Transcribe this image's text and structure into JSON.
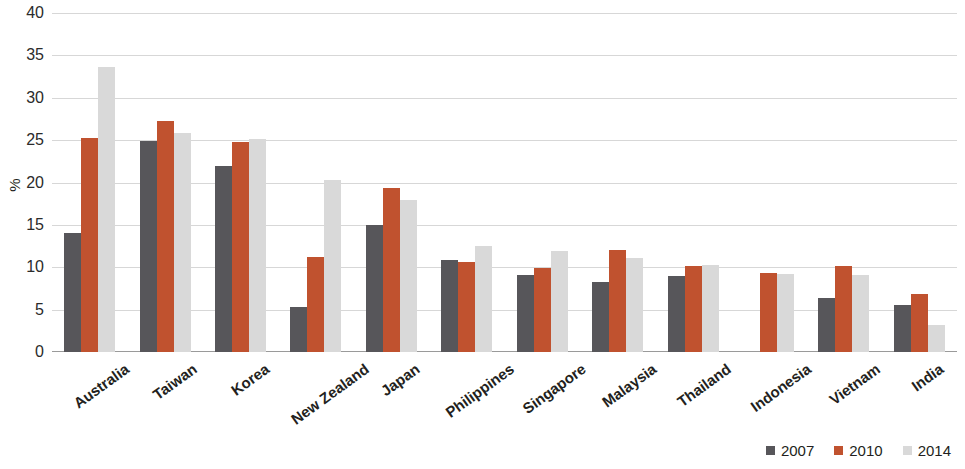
{
  "chart_data": {
    "type": "bar",
    "title": "",
    "xlabel": "",
    "ylabel": "%",
    "ylim": [
      0,
      40
    ],
    "yticks": [
      0,
      5,
      10,
      15,
      20,
      25,
      30,
      35,
      40
    ],
    "ytick_labels": [
      "0",
      "5",
      "10",
      "15",
      "20",
      "25",
      "30",
      "35",
      "40"
    ],
    "grid": true,
    "legend_position": "bottom-right",
    "categories": [
      "Australia",
      "Taiwan",
      "Korea",
      "New Zealand",
      "Japan",
      "Philippines",
      "Singapore",
      "Malaysia",
      "Thailand",
      "Indonesia",
      "Vietnam",
      "India"
    ],
    "series": [
      {
        "name": "2007",
        "color": "#57565a",
        "values": [
          14.1,
          24.9,
          21.9,
          5.3,
          15.0,
          10.8,
          9.1,
          8.3,
          9.0,
          null,
          6.4,
          5.6
        ]
      },
      {
        "name": "2010",
        "color": "#c0522f",
        "values": [
          25.3,
          27.2,
          24.8,
          11.2,
          19.3,
          10.6,
          9.9,
          12.0,
          10.2,
          9.3,
          10.1,
          6.9
        ]
      },
      {
        "name": "2014",
        "color": "#d9d9d9",
        "values": [
          33.6,
          25.9,
          25.1,
          20.3,
          17.9,
          12.5,
          11.9,
          11.1,
          10.3,
          9.2,
          9.1,
          3.2
        ]
      }
    ]
  },
  "legend": {
    "items": [
      {
        "label": "2007",
        "color": "#57565a"
      },
      {
        "label": "2010",
        "color": "#c0522f"
      },
      {
        "label": "2014",
        "color": "#d9d9d9"
      }
    ]
  }
}
